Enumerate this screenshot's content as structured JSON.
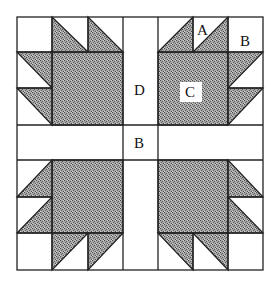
{
  "colors": {
    "background": "#ffffff",
    "line": "#222222",
    "fill_shaded": "#8f8f8f",
    "label_box": "#ffffff"
  },
  "grid": {
    "x": [
      17,
      52,
      88,
      123,
      158,
      193,
      228,
      263
    ],
    "y": [
      17,
      52,
      88,
      125,
      160,
      197,
      233,
      270
    ]
  },
  "labels": {
    "A": "A",
    "B_corner": "B",
    "C": "C",
    "D": "D",
    "B_sash": "B"
  },
  "pieces": {
    "A": "half-square triangle",
    "B": "plain square",
    "C": "large shaded square",
    "D": "sashing strip"
  }
}
